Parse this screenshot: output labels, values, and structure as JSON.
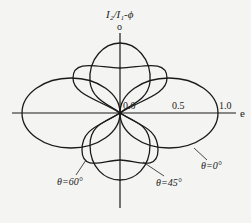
{
  "title": "I₂/I₁-ϕ",
  "axes": {
    "vertical_label": "o",
    "horizontal_label": "e",
    "ticks": [
      "0.0",
      "0.5",
      "1.0"
    ]
  },
  "curves": [
    {
      "label": "θ=0°"
    },
    {
      "label": "θ=45°"
    },
    {
      "label": "θ=60°"
    }
  ],
  "colors": {
    "line": "#1a1a1a",
    "background": "#f4f4f2"
  }
}
